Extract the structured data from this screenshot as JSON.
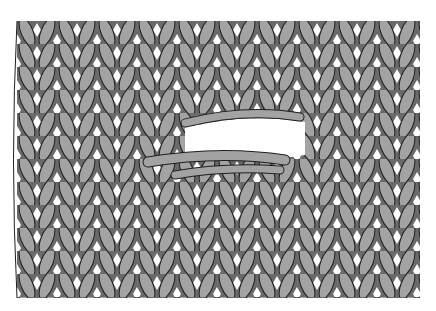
{
  "figure": {
    "colors": {
      "background": "#ffffff",
      "yarn": "#a3a3a3",
      "outline": "#1e1e1e",
      "shadow": "#6a6a6a"
    },
    "fabric": {
      "x": 17,
      "y": 21,
      "width": 403,
      "height": 277,
      "columns": 20,
      "row_height": 23
    },
    "hole": {
      "cx": 245,
      "cy": 140,
      "rx": 60,
      "ry": 14
    }
  }
}
